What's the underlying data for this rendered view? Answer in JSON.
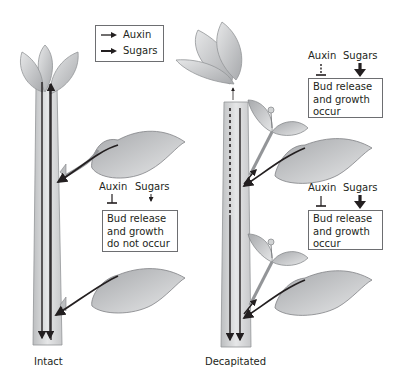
{
  "legend": {
    "items": [
      {
        "label": "Auxin",
        "icon": "thin-arrow-icon"
      },
      {
        "label": "Sugars",
        "icon": "thick-arrow-icon"
      }
    ]
  },
  "panels": [
    {
      "caption": "Intact",
      "signals": [
        {
          "auxin_label": "Auxin",
          "sugars_label": "Sugars",
          "auxin_effect": "inhibits (solid T-bar)",
          "sugars_effect": "weak (thin arrow)",
          "outcome": [
            "Bud release",
            "and growth",
            "do not occur"
          ]
        }
      ]
    },
    {
      "caption": "Decapitated",
      "signals": [
        {
          "auxin_label": "Auxin",
          "sugars_label": "Sugars",
          "auxin_effect": "reduced (dashed T-bar)",
          "sugars_effect": "strong (thick arrow)",
          "outcome": [
            "Bud release",
            "and growth",
            "occur"
          ]
        },
        {
          "auxin_label": "Auxin",
          "sugars_label": "Sugars",
          "auxin_effect": "inhibits (solid T-bar)",
          "sugars_effect": "strong (thick arrow)",
          "outcome": [
            "Bud release",
            "and growth",
            "occur"
          ]
        }
      ]
    }
  ],
  "colors": {
    "stem_fill": "#d9dadb",
    "stem_stroke": "#939598",
    "leaf_fill": "#c7c8ca",
    "arrow": "#231f20",
    "box_border": "#6d6e71"
  }
}
